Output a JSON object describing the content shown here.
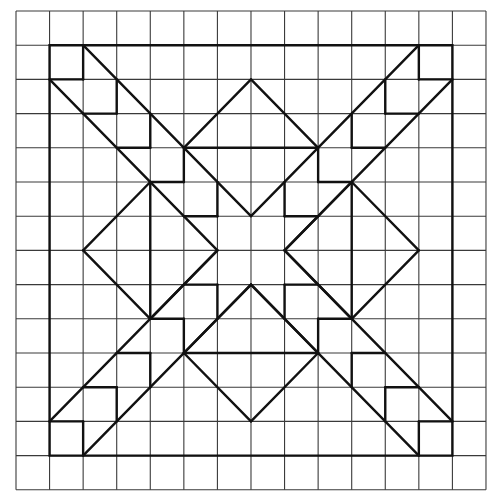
{
  "diagram": {
    "type": "quilt-block-grid",
    "grid": {
      "cells": 14,
      "origin_x": 16,
      "origin_y": 11,
      "cell_w": 33.57,
      "cell_h": 34.2,
      "line_color": "#3a3a3a"
    },
    "pattern": {
      "line_color": "#111111",
      "frame": [
        [
          1,
          1
        ],
        [
          13,
          1
        ],
        [
          13,
          13
        ],
        [
          1,
          13
        ]
      ],
      "segments": [
        [
          [
            2,
            1
          ],
          [
            2,
            2
          ]
        ],
        [
          [
            1,
            2
          ],
          [
            2,
            2
          ]
        ],
        [
          [
            12,
            1
          ],
          [
            12,
            2
          ]
        ],
        [
          [
            13,
            2
          ],
          [
            12,
            2
          ]
        ],
        [
          [
            2,
            13
          ],
          [
            2,
            12
          ]
        ],
        [
          [
            1,
            12
          ],
          [
            2,
            12
          ]
        ],
        [
          [
            12,
            13
          ],
          [
            12,
            12
          ]
        ],
        [
          [
            13,
            12
          ],
          [
            12,
            12
          ]
        ],
        [
          [
            2,
            1
          ],
          [
            7,
            6
          ]
        ],
        [
          [
            1,
            2
          ],
          [
            6,
            7
          ]
        ],
        [
          [
            12,
            1
          ],
          [
            7,
            6
          ]
        ],
        [
          [
            13,
            2
          ],
          [
            8,
            7
          ]
        ],
        [
          [
            2,
            13
          ],
          [
            7,
            8
          ]
        ],
        [
          [
            1,
            12
          ],
          [
            6,
            7
          ]
        ],
        [
          [
            12,
            13
          ],
          [
            7,
            8
          ]
        ],
        [
          [
            13,
            12
          ],
          [
            8,
            7
          ]
        ],
        [
          [
            3,
            2
          ],
          [
            3,
            3
          ]
        ],
        [
          [
            3,
            3
          ],
          [
            2,
            3
          ]
        ],
        [
          [
            4,
            3
          ],
          [
            4,
            4
          ]
        ],
        [
          [
            4,
            4
          ],
          [
            3,
            4
          ]
        ],
        [
          [
            5,
            4
          ],
          [
            5,
            5
          ]
        ],
        [
          [
            5,
            5
          ],
          [
            4,
            5
          ]
        ],
        [
          [
            6,
            5
          ],
          [
            6,
            6
          ]
        ],
        [
          [
            6,
            6
          ],
          [
            5,
            6
          ]
        ],
        [
          [
            11,
            2
          ],
          [
            11,
            3
          ]
        ],
        [
          [
            11,
            3
          ],
          [
            12,
            3
          ]
        ],
        [
          [
            10,
            3
          ],
          [
            10,
            4
          ]
        ],
        [
          [
            10,
            4
          ],
          [
            11,
            4
          ]
        ],
        [
          [
            9,
            4
          ],
          [
            9,
            5
          ]
        ],
        [
          [
            9,
            5
          ],
          [
            10,
            5
          ]
        ],
        [
          [
            8,
            5
          ],
          [
            8,
            6
          ]
        ],
        [
          [
            8,
            6
          ],
          [
            9,
            6
          ]
        ],
        [
          [
            3,
            12
          ],
          [
            3,
            11
          ]
        ],
        [
          [
            3,
            11
          ],
          [
            2,
            11
          ]
        ],
        [
          [
            4,
            11
          ],
          [
            4,
            10
          ]
        ],
        [
          [
            4,
            10
          ],
          [
            3,
            10
          ]
        ],
        [
          [
            5,
            10
          ],
          [
            5,
            9
          ]
        ],
        [
          [
            5,
            9
          ],
          [
            4,
            9
          ]
        ],
        [
          [
            6,
            9
          ],
          [
            6,
            8
          ]
        ],
        [
          [
            6,
            8
          ],
          [
            5,
            8
          ]
        ],
        [
          [
            11,
            12
          ],
          [
            11,
            11
          ]
        ],
        [
          [
            11,
            11
          ],
          [
            12,
            11
          ]
        ],
        [
          [
            10,
            11
          ],
          [
            10,
            10
          ]
        ],
        [
          [
            10,
            10
          ],
          [
            11,
            10
          ]
        ],
        [
          [
            9,
            10
          ],
          [
            9,
            9
          ]
        ],
        [
          [
            9,
            9
          ],
          [
            10,
            9
          ]
        ],
        [
          [
            8,
            9
          ],
          [
            8,
            8
          ]
        ],
        [
          [
            8,
            8
          ],
          [
            9,
            8
          ]
        ],
        [
          [
            7,
            2
          ],
          [
            5,
            4
          ]
        ],
        [
          [
            7,
            2
          ],
          [
            9,
            4
          ]
        ],
        [
          [
            5,
            4
          ],
          [
            9,
            4
          ]
        ],
        [
          [
            7,
            12
          ],
          [
            5,
            10
          ]
        ],
        [
          [
            7,
            12
          ],
          [
            9,
            10
          ]
        ],
        [
          [
            5,
            10
          ],
          [
            9,
            10
          ]
        ],
        [
          [
            5,
            10
          ],
          [
            7,
            8
          ]
        ],
        [
          [
            9,
            10
          ],
          [
            7,
            8
          ]
        ],
        [
          [
            2,
            7
          ],
          [
            4,
            5
          ]
        ],
        [
          [
            2,
            7
          ],
          [
            4,
            9
          ]
        ],
        [
          [
            4,
            5
          ],
          [
            4,
            9
          ]
        ],
        [
          [
            4,
            9
          ],
          [
            6,
            7
          ]
        ],
        [
          [
            12,
            7
          ],
          [
            10,
            5
          ]
        ],
        [
          [
            12,
            7
          ],
          [
            10,
            9
          ]
        ],
        [
          [
            10,
            5
          ],
          [
            10,
            9
          ]
        ],
        [
          [
            10,
            5
          ],
          [
            8,
            7
          ]
        ],
        [
          [
            10,
            9
          ],
          [
            8,
            7
          ]
        ]
      ]
    },
    "shapes": [
      {
        "name": "outer-frame",
        "description": "12x12 square frame"
      },
      {
        "name": "top-diamond",
        "vertices": [
          [
            7,
            2
          ],
          [
            9,
            4
          ],
          [
            7,
            6
          ],
          [
            5,
            4
          ]
        ]
      },
      {
        "name": "bottom-diamond",
        "vertices": [
          [
            7,
            8
          ],
          [
            9,
            10
          ],
          [
            7,
            12
          ],
          [
            5,
            10
          ]
        ]
      },
      {
        "name": "left-diamond",
        "vertices": [
          [
            2,
            7
          ],
          [
            4,
            5
          ],
          [
            6,
            7
          ],
          [
            4,
            9
          ]
        ]
      },
      {
        "name": "right-diamond",
        "vertices": [
          [
            8,
            7
          ],
          [
            10,
            5
          ],
          [
            12,
            7
          ],
          [
            10,
            9
          ]
        ]
      },
      {
        "name": "corner-squares",
        "count": 4
      },
      {
        "name": "diagonal-staircases",
        "count": 4
      }
    ]
  }
}
